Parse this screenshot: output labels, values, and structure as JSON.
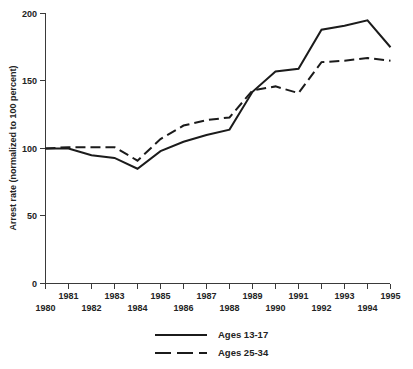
{
  "chart_data": {
    "type": "line",
    "title": "",
    "xlabel": "",
    "ylabel": "Arrest rate (normalized to 100 percent)",
    "x": [
      1980,
      1981,
      1982,
      1983,
      1984,
      1985,
      1986,
      1987,
      1988,
      1989,
      1990,
      1991,
      1992,
      1993,
      1994,
      1995
    ],
    "xtick_labels": [
      "1980",
      "1981",
      "1982",
      "1983",
      "1984",
      "1985",
      "1986",
      "1987",
      "1988",
      "1989",
      "1990",
      "1991",
      "1992",
      "1993",
      "1994",
      "1995"
    ],
    "ytick_labels": [
      "0",
      "50",
      "100",
      "150",
      "200"
    ],
    "ytick_values": [
      0,
      50,
      100,
      150,
      200
    ],
    "xlim": [
      1980,
      1995
    ],
    "ylim": [
      0,
      200
    ],
    "grid": false,
    "legend_position": "below-axes-center",
    "series": [
      {
        "name": "Ages 13-17",
        "style": "solid",
        "color": "#1b1b1b",
        "values": [
          100,
          100,
          95,
          93,
          85,
          98,
          105,
          110,
          114,
          142,
          157,
          159,
          188,
          191,
          195,
          175
        ]
      },
      {
        "name": "Ages 25-34",
        "style": "dashed",
        "color": "#1b1b1b",
        "values": [
          100,
          101,
          101,
          101,
          91,
          107,
          117,
          121,
          123,
          143,
          146,
          141,
          164,
          165,
          167,
          165
        ]
      }
    ]
  },
  "legend": {
    "entries": [
      {
        "label": "Ages 13-17",
        "style": "solid"
      },
      {
        "label": "Ages 25-34",
        "style": "dashed"
      }
    ]
  },
  "caption": {
    "text": "",
    "visible_fragment": ""
  }
}
